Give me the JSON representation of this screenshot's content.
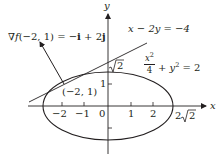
{
  "figure": {
    "axes": {
      "x_label": "x",
      "y_label": "y",
      "x_ticks": [
        {
          "value": -2,
          "label": "−2"
        },
        {
          "value": -1,
          "label": "−1"
        },
        {
          "value": 0,
          "label": "0"
        },
        {
          "value": 1,
          "label": "1"
        },
        {
          "value": 2,
          "label": "2"
        }
      ],
      "y_ticks": [
        {
          "value": 1,
          "label": "1"
        }
      ],
      "x_intercept_label": {
        "prefix": "2",
        "radicand": "2"
      },
      "y_intercept_label": {
        "radicand": "2"
      }
    },
    "ellipse": {
      "equation_x_num": "x",
      "equation_x_exp": "2",
      "equation_x_den": "4",
      "equation_rest": "+ y",
      "equation_y_exp": "2",
      "equation_rhs": "= 2"
    },
    "tangent_line": {
      "equation": "x − 2y = −4"
    },
    "point": {
      "label": "(−2, 1)"
    },
    "gradient": {
      "nabla": "∇",
      "f": "f",
      "args": "(−2, 1) = −",
      "i": "i",
      "plus": " + 2",
      "j": "j"
    },
    "colors": {
      "ink": "#231f20",
      "background": "#ffffff"
    }
  }
}
